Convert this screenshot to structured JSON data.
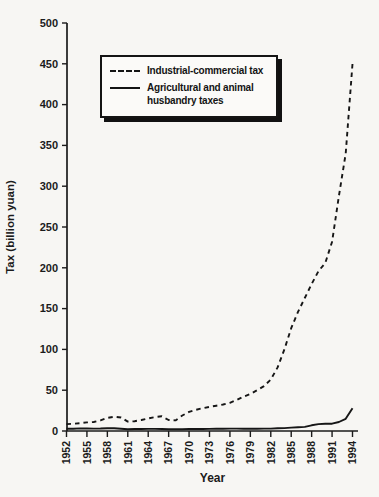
{
  "figure": {
    "x_axis_title": "Year",
    "y_axis_title": "Tax (billion yuan)",
    "ink_color": "#1b1b1b",
    "background_color": "#f7f6f3"
  },
  "legend": {
    "items": [
      {
        "label": "Industrial-commercial tax",
        "line_style": "dashed"
      },
      {
        "label": "Agricultural and animal husbandry taxes",
        "line_style": "solid"
      }
    ]
  },
  "chart_data": {
    "type": "line",
    "title": "",
    "xlabel": "Year",
    "ylabel": "Tax (billion yuan)",
    "xlim": [
      1952,
      1994
    ],
    "ylim": [
      0,
      500
    ],
    "x_ticks": [
      1952,
      1955,
      1958,
      1961,
      1964,
      1967,
      1970,
      1973,
      1976,
      1979,
      1982,
      1985,
      1988,
      1991,
      1994
    ],
    "y_ticks": [
      0,
      50,
      100,
      150,
      200,
      250,
      300,
      350,
      400,
      450,
      500
    ],
    "grid": false,
    "legend_position": "upper-left-inside",
    "x": [
      1952,
      1953,
      1954,
      1955,
      1956,
      1957,
      1958,
      1959,
      1960,
      1961,
      1962,
      1963,
      1964,
      1965,
      1966,
      1967,
      1968,
      1969,
      1970,
      1971,
      1972,
      1973,
      1974,
      1975,
      1976,
      1977,
      1978,
      1979,
      1980,
      1981,
      1982,
      1983,
      1984,
      1985,
      1986,
      1987,
      1988,
      1989,
      1990,
      1991,
      1992,
      1993,
      1994
    ],
    "series": [
      {
        "name": "Industrial-commercial tax",
        "line_style": "dashed",
        "color": "#161616",
        "values": [
          8.5,
          9,
          9.5,
          10.5,
          11,
          13,
          16,
          17.5,
          16.5,
          11.5,
          12,
          13.5,
          15.5,
          17,
          18,
          13.5,
          13,
          19,
          23.5,
          26,
          28,
          29.5,
          31,
          32.5,
          34.5,
          38,
          42,
          45.5,
          50,
          55,
          63,
          78,
          100,
          126,
          146,
          163,
          180,
          196,
          206,
          232,
          288,
          340,
          450
        ]
      },
      {
        "name": "Agricultural and animal husbandry taxes",
        "line_style": "solid",
        "color": "#161616",
        "values": [
          2.7,
          2.8,
          3.2,
          3.1,
          3.0,
          3.1,
          3.4,
          3.3,
          2.8,
          2.2,
          2.4,
          2.5,
          2.6,
          2.6,
          2.5,
          2.2,
          2.1,
          2.2,
          2.4,
          2.5,
          2.5,
          2.6,
          2.7,
          2.8,
          2.9,
          2.9,
          2.8,
          3.0,
          2.8,
          2.9,
          3.0,
          3.3,
          3.5,
          4.2,
          4.5,
          5.0,
          7.0,
          8.4,
          8.8,
          9.0,
          11.0,
          15.0,
          28.0
        ]
      }
    ]
  }
}
